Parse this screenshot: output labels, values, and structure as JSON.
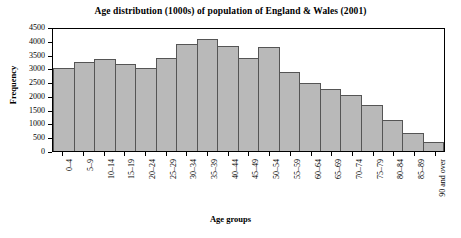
{
  "chart_data": {
    "type": "bar",
    "title": "Age distribution (1000s) of population of England & Wales (2001)",
    "xlabel": "Age groups",
    "ylabel": "Frequency",
    "ylim": [
      0,
      4500
    ],
    "ytick_step": 500,
    "yticks": [
      0,
      500,
      1000,
      1500,
      2000,
      2500,
      3000,
      3500,
      4000,
      4500
    ],
    "ytick_labels": [
      "0",
      "500",
      "1000",
      "1500",
      "2000",
      "2500",
      "3000",
      "3500",
      "4000",
      "4500"
    ],
    "grid": false,
    "legend": "none",
    "bar_color": "#b9b9b9",
    "bar_edge_color": "#555555",
    "categories": [
      "0–4",
      "5–9",
      "10–14",
      "15–19",
      "20–24",
      "25–29",
      "30–34",
      "35–39",
      "40–44",
      "45–49",
      "50–54",
      "55–59",
      "60–64",
      "65–69",
      "70–74",
      "75–79",
      "80–84",
      "85–89",
      "90 and over"
    ],
    "values": [
      3050,
      3300,
      3380,
      3200,
      3080,
      3430,
      3950,
      4120,
      3880,
      3430,
      3820,
      2930,
      2520,
      2270,
      2050,
      1700,
      1150,
      680,
      330
    ]
  }
}
